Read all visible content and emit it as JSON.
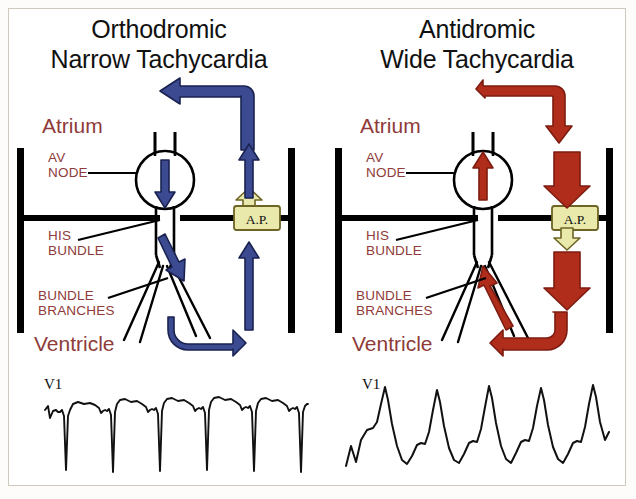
{
  "figure": {
    "background_color": "#ffffff",
    "border_color": "#cfc9bd",
    "label_color": "#8e3b39",
    "title_color": "#111111",
    "line_color": "#000000",
    "ap_box_fill": "#e9e9ac",
    "ap_box_stroke": "#9a8c3a"
  },
  "panels": [
    {
      "id": "orthodromic",
      "title_line1": "Orthodromic",
      "title_line2": "Narrow Tachycardia",
      "arrow_color": "#3b4a91",
      "labels": {
        "atrium": "Atrium",
        "av_node_line1": "AV",
        "av_node_line2": "NODE",
        "his_line1": "HIS",
        "his_line2": "BUNDLE",
        "branches_line1": "BUNDLE",
        "branches_line2": "BRANCHES",
        "ventricle": "Ventricle",
        "accessory_pathway": "A.P.",
        "ecg_lead": "V1"
      },
      "ecg_description": "narrow QRS tachycardia with deep negative QRS deflections"
    },
    {
      "id": "antidromic",
      "title_line1": "Antidromic",
      "title_line2": "Wide Tachycardia",
      "arrow_color": "#b02d1c",
      "labels": {
        "atrium": "Atrium",
        "av_node_line1": "AV",
        "av_node_line2": "NODE",
        "his_line1": "HIS",
        "his_line2": "BUNDLE",
        "branches_line1": "BUNDLE",
        "branches_line2": "BRANCHES",
        "ventricle": "Ventricle",
        "accessory_pathway": "A.P.",
        "ecg_lead": "V1"
      },
      "ecg_description": "wide QRS tachycardia with tall broad positive QRS complexes"
    }
  ]
}
